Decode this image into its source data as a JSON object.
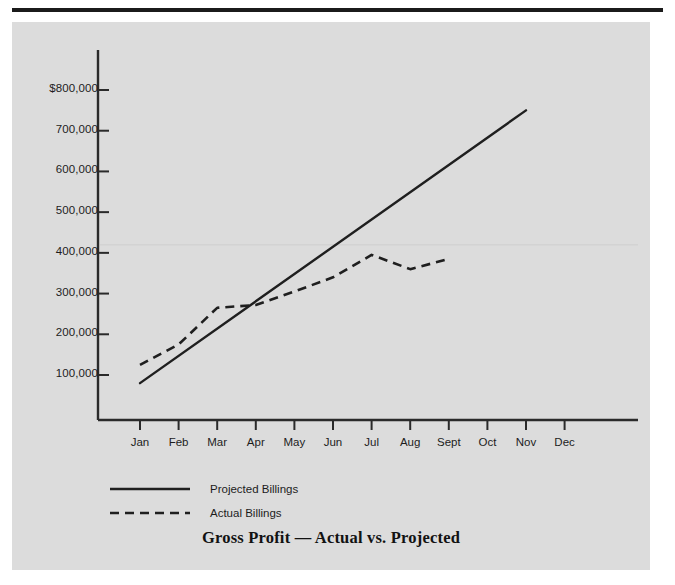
{
  "chart_data": {
    "type": "line",
    "title": "Gross Profit — Actual vs. Projected",
    "xlabel": "",
    "ylabel": "",
    "categories": [
      "Jan",
      "Feb",
      "Mar",
      "Apr",
      "May",
      "Jun",
      "Jul",
      "Aug",
      "Sept",
      "Oct",
      "Nov",
      "Dec"
    ],
    "ylim": [
      0,
      800000
    ],
    "ytick_values": [
      800000,
      700000,
      600000,
      500000,
      400000,
      300000,
      200000,
      100000
    ],
    "ytick_labels": [
      "$800,000",
      "700,000",
      "600,000",
      "500,000",
      "400,000",
      "300,000",
      "200,000",
      "100,000"
    ],
    "grid": false,
    "legend_position": "below-plot-left",
    "series": [
      {
        "name": "Projected Billings",
        "style": "solid",
        "color": "#1f1f1f",
        "x": [
          "Jan",
          "Nov"
        ],
        "values": [
          80000,
          750000
        ]
      },
      {
        "name": "Actual Billings",
        "style": "dashed",
        "color": "#1f1f1f",
        "x": [
          "Jan",
          "Feb",
          "Mar",
          "Apr",
          "May",
          "Jun",
          "Jul",
          "Aug",
          "Sept"
        ],
        "values": [
          125000,
          175000,
          265000,
          272000,
          305000,
          340000,
          395000,
          360000,
          385000
        ]
      }
    ]
  },
  "legend": {
    "items": [
      {
        "label": "Projected Billings",
        "style": "solid"
      },
      {
        "label": "Actual Billings",
        "style": "dashed"
      }
    ]
  },
  "colors": {
    "panel_background": "#dcdcdc",
    "page_background": "#ffffff",
    "ink": "#1f1f1f",
    "rule": "#1b1b1b"
  }
}
